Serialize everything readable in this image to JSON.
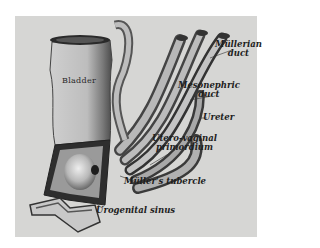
{
  "figure": {
    "background": "#d6d6d4",
    "labels": {
      "bladder": "Bladder",
      "mullerian_duct_1": "Müllerian",
      "mullerian_duct_2": "duct",
      "mesonephric_duct_1": "Mesonephric",
      "mesonephric_duct_2": "duct",
      "ureter": "Ureter",
      "utero_vaginal_1": "Utero-vaginal",
      "utero_vaginal_2": "primordium",
      "mullers_tubercle": "Müller's tubercle",
      "urogenital_sinus": "Urogenital sinus"
    }
  }
}
